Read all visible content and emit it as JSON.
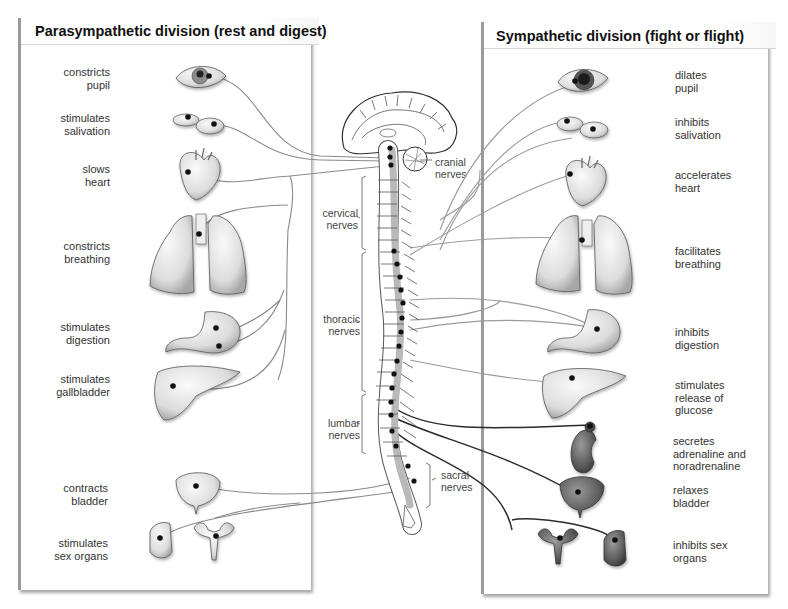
{
  "parasympathetic": {
    "title": "Parasympathetic division (rest and digest)",
    "effects": [
      {
        "organ": "eye",
        "label": "constricts\npupil",
        "lines": [
          "constricts",
          "pupil"
        ]
      },
      {
        "organ": "salivary-glands",
        "label": "stimulates\nsalivation",
        "lines": [
          "stimulates",
          "salivation"
        ]
      },
      {
        "organ": "heart",
        "label": "slows\nheart",
        "lines": [
          "slows",
          "heart"
        ]
      },
      {
        "organ": "lungs",
        "label": "constricts\nbreathing",
        "lines": [
          "constricts",
          "breathing"
        ]
      },
      {
        "organ": "stomach",
        "label": "stimulates\ndigestion",
        "lines": [
          "stimulates",
          "digestion"
        ]
      },
      {
        "organ": "liver-gallbladder",
        "label": "stimulates\ngallbladder",
        "lines": [
          "stimulates",
          "gallbladder"
        ]
      },
      {
        "organ": "bladder",
        "label": "contracts\nbladder",
        "lines": [
          "contracts",
          "bladder"
        ]
      },
      {
        "organ": "sex-organs",
        "label": "stimulates\nsex organs",
        "lines": [
          "stimulates",
          "sex organs"
        ]
      }
    ]
  },
  "sympathetic": {
    "title": "Sympathetic division (fight or flight)",
    "effects": [
      {
        "organ": "eye",
        "lines": [
          "dilates",
          "pupil"
        ]
      },
      {
        "organ": "salivary-glands",
        "lines": [
          "inhibits",
          "salivation"
        ]
      },
      {
        "organ": "heart",
        "lines": [
          "accelerates",
          "heart"
        ]
      },
      {
        "organ": "lungs",
        "lines": [
          "facilitates",
          "breathing"
        ]
      },
      {
        "organ": "stomach",
        "lines": [
          "inhibits",
          "digestion"
        ]
      },
      {
        "organ": "liver",
        "lines": [
          "stimulates",
          "release of",
          "glucose"
        ]
      },
      {
        "organ": "adrenal-kidney",
        "lines": [
          "secretes",
          "adrenaline and",
          "noradrenaline"
        ]
      },
      {
        "organ": "bladder",
        "lines": [
          "relaxes",
          "bladder"
        ]
      },
      {
        "organ": "sex-organs",
        "lines": [
          "inhibits sex",
          "organs"
        ]
      }
    ]
  },
  "central": {
    "nerve_groups": [
      {
        "name": "cranial",
        "lines": [
          "cranial",
          "nerves"
        ]
      },
      {
        "name": "cervical",
        "lines": [
          "cervical",
          "nerves"
        ]
      },
      {
        "name": "thoracic",
        "lines": [
          "thoracic",
          "nerves"
        ]
      },
      {
        "name": "lumbar",
        "lines": [
          "lumbar",
          "nerves"
        ]
      },
      {
        "name": "sacral",
        "lines": [
          "sacral",
          "nerves"
        ]
      }
    ]
  },
  "colors": {
    "panel_border": "#9a9a9a",
    "nerve_para": "#8a8a8a",
    "nerve_symp_dark": "#2b2b2b",
    "organ_fill": "#e4e4e4",
    "organ_dark_fill": "#6e6e6e",
    "spinal_cord_fill": "#b9b9b9"
  }
}
